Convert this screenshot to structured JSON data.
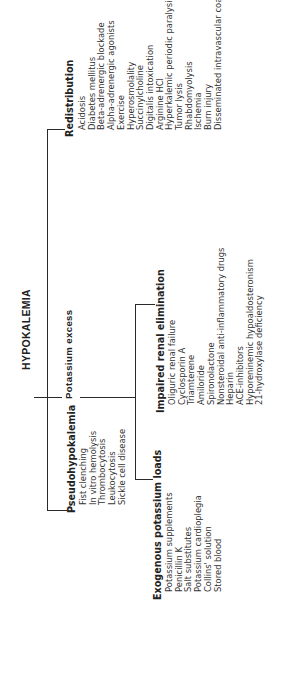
{
  "title": "HYPOKALEMIA",
  "branches": {
    "pseudohypokalemia": {
      "label": "Pseudohypokalemia",
      "items": [
        "Fist clenching",
        "In vitro hemolysis",
        "Thrombocytosis",
        "Leukocytosis",
        "Sickle cell disease"
      ]
    },
    "potassium_excess": {
      "label": "Potassium excess",
      "sub": {
        "exogenous": {
          "label": "Exogenous potassium loads",
          "items": [
            "Potassium supplements",
            "Penicillin K",
            "Salt substitutes",
            "Potassium cardioplegia",
            "Collins' solution",
            "Stored blood"
          ]
        },
        "renal": {
          "label": "Impaired renal elimination",
          "items": [
            "Oliguric renal failure",
            "Cyclosporin A",
            "Triamterene",
            "Amiloride",
            "Spironolactone",
            "Nonsteroidal anti-inflammatory drugs",
            "Heparin",
            "ACE-inhibitors",
            "Hyporeninemic hypoaldosteronism",
            "21-hydroxylase deficiency"
          ]
        }
      }
    },
    "redistribution": {
      "label": "Redistribution",
      "items": [
        "Acidosis",
        "Diabetes mellitus",
        "Beta-adrenergic blockade",
        "Alpha-adrenergic agonists",
        "Exercise",
        "Hyperosmolality",
        "Succinylcholine",
        "Digitalis intoxication",
        "Arginine HCl",
        "Hyperkalemic periodic paralysis",
        "Tumor lysis",
        "Rhabdomyolysis",
        "Ischemia",
        "Burn injury",
        "Disseminated intravascular coagulation"
      ]
    }
  }
}
